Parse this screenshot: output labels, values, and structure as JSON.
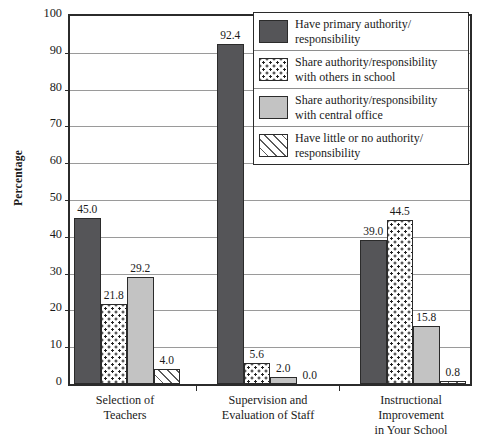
{
  "chart_data": {
    "type": "bar",
    "title": "",
    "xlabel": "",
    "ylabel": "Percentage",
    "ylim": [
      0,
      100
    ],
    "yticks": [
      0,
      10,
      20,
      30,
      40,
      50,
      60,
      70,
      80,
      90,
      100
    ],
    "grid": true,
    "legend_position": "top-right",
    "categories": [
      "Selection of\nTeachers",
      "Supervision and\nEvaluation of Staff",
      "Instructional\nImprovement\nin Your School"
    ],
    "category_lines": [
      [
        "Selection of",
        "Teachers"
      ],
      [
        "Supervision and",
        "Evaluation of Staff"
      ],
      [
        "Instructional",
        "Improvement",
        "in Your School"
      ]
    ],
    "series": [
      {
        "name": "Have primary authority/responsibility",
        "label_lines": [
          "Have primary authority/",
          "responsibility"
        ],
        "pattern": "solid-dark",
        "color": "#555558",
        "values": [
          45.0,
          92.4,
          39.0
        ],
        "value_labels": [
          "45.0",
          "92.4",
          "39.0"
        ]
      },
      {
        "name": "Share authority/responsibility with others in school",
        "label_lines": [
          "Share authority/responsibility",
          "with others in school"
        ],
        "pattern": "dotted",
        "color": "#ffffff",
        "values": [
          21.8,
          5.6,
          44.5
        ],
        "value_labels": [
          "21.8",
          "5.6",
          "44.5"
        ]
      },
      {
        "name": "Share authority/responsibility with central office",
        "label_lines": [
          "Share authority/responsibility",
          "with central office"
        ],
        "pattern": "solid-light",
        "color": "#c3c3c3",
        "values": [
          29.2,
          2.0,
          15.8
        ],
        "value_labels": [
          "29.2",
          "2.0",
          "15.8"
        ]
      },
      {
        "name": "Have little or no authority/responsibility",
        "label_lines": [
          "Have little or no authority/",
          "responsibility"
        ],
        "pattern": "diagonal-hatch",
        "color": "#ffffff",
        "values": [
          4.0,
          0.0,
          0.8
        ],
        "value_labels": [
          "4.0",
          "0.0",
          "0.8"
        ]
      }
    ]
  },
  "axes": {
    "y_title": "Percentage",
    "y_tick_labels": [
      "100",
      "90",
      "80",
      "70",
      "60",
      "50",
      "40",
      "30",
      "20",
      "10",
      "0"
    ]
  },
  "legend": {
    "rows": [
      {
        "swatch": "legend-swatch-primary-authority",
        "line1": "Have primary authority/",
        "line2": "responsibility"
      },
      {
        "swatch": "legend-swatch-share-others-school",
        "line1": "Share authority/responsibility",
        "line2": "with others in school"
      },
      {
        "swatch": "legend-swatch-share-central-office",
        "line1": "Share authority/responsibility",
        "line2": "with central office"
      },
      {
        "swatch": "legend-swatch-little-no-authority",
        "line1": "Have little or no authority/",
        "line2": "responsibility"
      }
    ]
  },
  "colors": {
    "series_primary": "#555558",
    "series_central_office": "#c3c3c3",
    "axis": "#2b2b2b",
    "gridline": "#9a9a9a",
    "background": "#ffffff"
  }
}
